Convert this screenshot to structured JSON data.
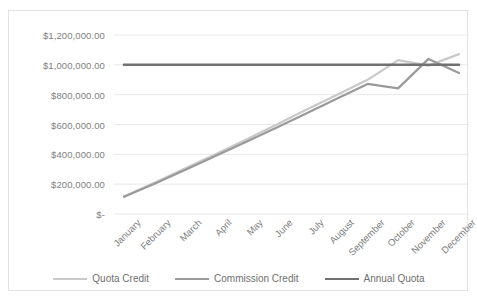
{
  "title_fragment": "",
  "chart_data": {
    "type": "line",
    "title": "",
    "xlabel": "",
    "ylabel": "",
    "categories": [
      "January",
      "February",
      "March",
      "April",
      "May",
      "June",
      "July",
      "August",
      "September",
      "October",
      "November",
      "December"
    ],
    "ylim": [
      0,
      1200000
    ],
    "ytick_values": [
      0,
      200000,
      400000,
      600000,
      800000,
      1000000,
      1200000
    ],
    "ytick_labels": [
      "$-",
      "$200,000.00",
      "$400,000.00",
      "$600,000.00",
      "$800,000.00",
      "$1,000,000.00",
      "$1,200,000.00"
    ],
    "grid": true,
    "legend_position": "bottom",
    "series": [
      {
        "name": "Quota Credit",
        "color": "#c9c9c9",
        "values": [
          118000,
          210000,
          305000,
          400000,
          498000,
          598000,
          700000,
          800000,
          900000,
          1032000,
          995000,
          1072000
        ]
      },
      {
        "name": "Commission Credit",
        "color": "#9a9a9a",
        "values": [
          115000,
          203000,
          295000,
          388000,
          482000,
          578000,
          675000,
          775000,
          872000,
          842000,
          1040000,
          945000
        ]
      },
      {
        "name": "Annual Quota",
        "color": "#707070",
        "values": [
          1000000,
          1000000,
          1000000,
          1000000,
          1000000,
          1000000,
          1000000,
          1000000,
          1000000,
          1000000,
          1000000,
          1000000
        ]
      }
    ]
  },
  "colors": {
    "frame_border": "#e2e2e2",
    "gridline": "#e8e8e8",
    "axis_text": "#808080",
    "legend_text": "#6f6f6f",
    "background": "#ffffff"
  }
}
